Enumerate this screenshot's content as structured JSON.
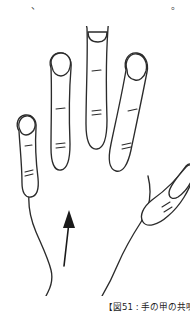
{
  "page": {
    "background_color": "#ffffff",
    "ink_color": "#2b2b2b",
    "text_color": "#3a3a3a"
  },
  "top_text": {
    "orientation": "vertical-rtl",
    "note": "bottom edge of a vertical Japanese text block, clipped by the crop",
    "columns": [
      {
        "text": "か\n、"
      },
      {
        "text": "だ"
      },
      {
        "text": "く"
      },
      {
        "text": "っ"
      },
      {
        "text": "で"
      },
      {
        "text": "が"
      },
      {
        "text": "り"
      },
      {
        "text": "ん\n。"
      }
    ]
  },
  "illustration": {
    "name": "back-of-hand-line-drawing",
    "description": "Line drawing of the back of a left hand, fingers spread, thumb at right, wrist at bottom",
    "stroke_color": "#2b2b2b",
    "fill_color": "#ffffff",
    "arrow": {
      "name": "upward-arrow",
      "direction": "up",
      "color": "#1a1a1a"
    },
    "parts": [
      {
        "label": "pinky-finger"
      },
      {
        "label": "ring-finger"
      },
      {
        "label": "middle-finger"
      },
      {
        "label": "index-finger"
      },
      {
        "label": "thumb"
      },
      {
        "label": "hand-back"
      },
      {
        "label": "wrist"
      }
    ]
  },
  "caption": {
    "text": "【図51 : 手の甲の共鳴",
    "clipped": true
  }
}
